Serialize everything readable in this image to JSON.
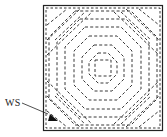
{
  "figure": {
    "label": "WS",
    "colors": {
      "line": "#222222",
      "background": "#ffffff"
    },
    "frame": {
      "x": 43,
      "y": 5,
      "width": 120,
      "height": 126
    },
    "center": {
      "x": 103,
      "y": 68
    },
    "rings": 6
  }
}
